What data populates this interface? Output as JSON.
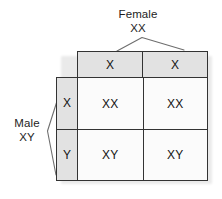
{
  "diagram": {
    "type": "punnett-square",
    "female": {
      "label_line_1": "Female",
      "label_line_2": "XX",
      "bracket": "caret-down-bracket"
    },
    "male": {
      "label_line_1": "Male",
      "label_line_2": "XY",
      "bracket": "angle-left-bracket"
    },
    "column_headers": [
      "X",
      "X"
    ],
    "row_headers": [
      "X",
      "Y"
    ],
    "cells": [
      [
        "XX",
        "XX"
      ],
      [
        "XY",
        "XY"
      ]
    ],
    "colors": {
      "header_fill": "#e2e2e2",
      "cell_fill": "#fbfbfb",
      "border": "#333333",
      "text": "#141414",
      "shadow": "#c9c9c9",
      "background": "#ffffff"
    }
  }
}
